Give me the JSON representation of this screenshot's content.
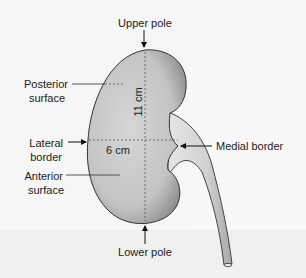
{
  "diagram": {
    "labels": {
      "upper_pole": "Upper pole",
      "posterior_surface_line1": "Posterior",
      "posterior_surface_line2": "surface",
      "lateral_border_line1": "Lateral",
      "lateral_border_line2": "border",
      "anterior_surface_line1": "Anterior",
      "anterior_surface_line2": "surface",
      "medial_border": "Medial border",
      "lower_pole": "Lower pole"
    },
    "measurements": {
      "length": "11 cm",
      "width": "6 cm"
    },
    "colors": {
      "kidney_fill": "#c9c9c9",
      "kidney_outline": "#333333",
      "ureter_fill": "#dcdcdc",
      "text": "#222222",
      "background": "#f6f6f6"
    }
  }
}
